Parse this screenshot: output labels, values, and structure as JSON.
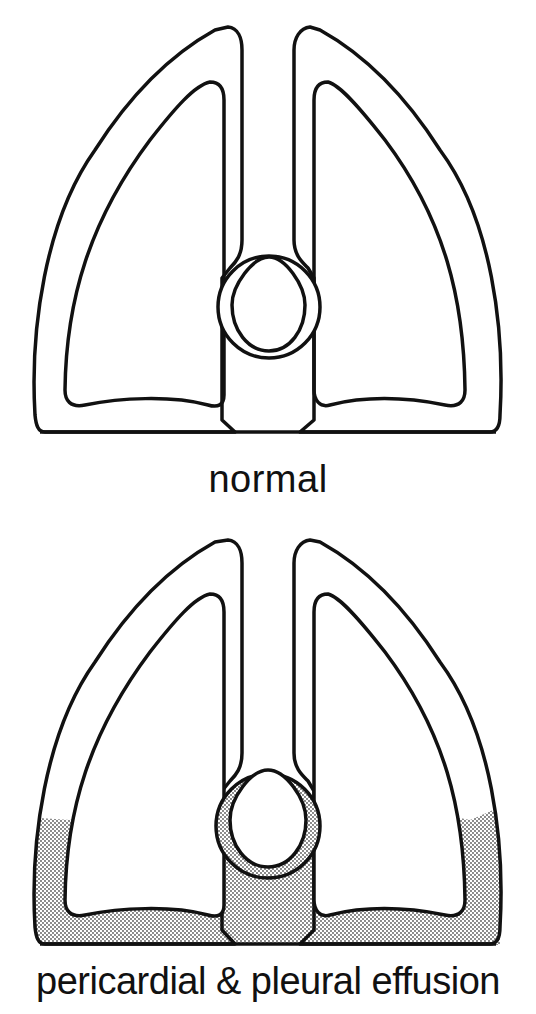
{
  "panels": [
    {
      "id": "normal",
      "caption": "normal",
      "effusion": false
    },
    {
      "id": "effusion",
      "caption": "pericardial & pleural effusion",
      "effusion": true
    }
  ],
  "colors": {
    "line": "#111111",
    "background": "#ffffff",
    "stipple": "#555555"
  }
}
